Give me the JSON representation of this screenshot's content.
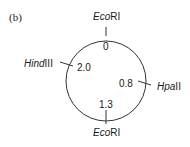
{
  "panel_label": "(b)",
  "map": {
    "type": "circular restriction map",
    "sites": [
      {
        "enzyme_italic": "Eco",
        "enzyme_rest": "RI",
        "position": "0"
      },
      {
        "enzyme_italic": "Hpa",
        "enzyme_rest": "II",
        "position": "0.8"
      },
      {
        "enzyme_italic": "Eco",
        "enzyme_rest": "RI",
        "position": "1.3"
      },
      {
        "enzyme_italic": "Hind",
        "enzyme_rest": "III",
        "position": "2.0"
      }
    ]
  }
}
